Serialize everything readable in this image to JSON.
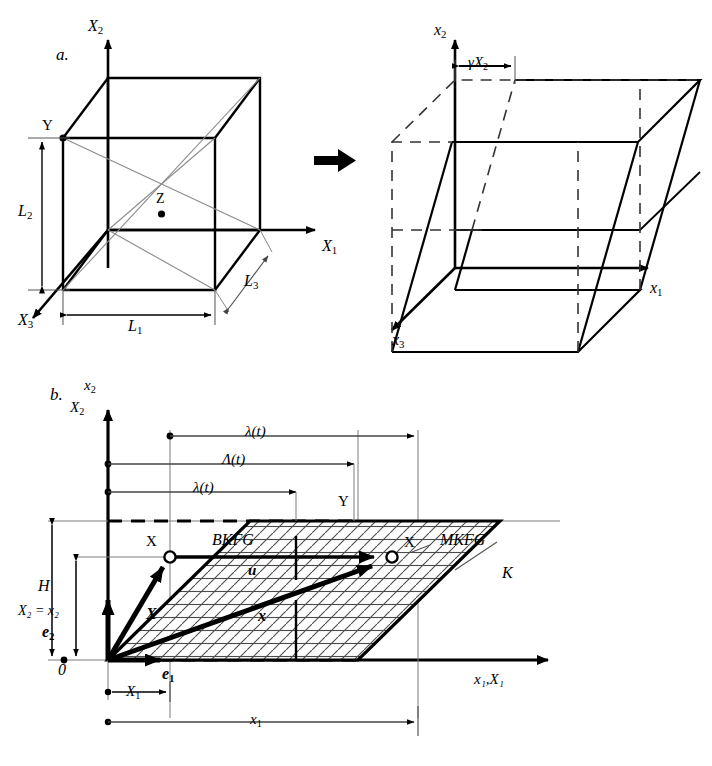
{
  "figure": {
    "background_color": "#ffffff",
    "line_color": "#000000",
    "thin_line_color": "#555555",
    "width": 712,
    "height": 766
  },
  "panel_a": {
    "letter": "a.",
    "transform_arrow": "arrow-right-icon",
    "reference_cube": {
      "axes": [
        {
          "name": "X2",
          "label": "X",
          "sub": "2",
          "direction": "up"
        },
        {
          "name": "X1",
          "label": "X",
          "sub": "1",
          "direction": "right"
        },
        {
          "name": "X3",
          "label": "X",
          "sub": "3",
          "direction": "down-left"
        }
      ],
      "points": [
        {
          "name": "Y",
          "label": "Y"
        },
        {
          "name": "Z",
          "label": "Z"
        }
      ],
      "dimensions": [
        {
          "name": "L1",
          "label": "L",
          "sub": "1",
          "orientation": "horizontal"
        },
        {
          "name": "L2",
          "label": "L",
          "sub": "2",
          "orientation": "vertical"
        },
        {
          "name": "L3",
          "label": "L",
          "sub": "3",
          "orientation": "diagonal"
        }
      ]
    },
    "deformed_cube": {
      "axes": [
        {
          "name": "x2",
          "label": "x",
          "sub": "2",
          "direction": "up"
        },
        {
          "name": "x1",
          "label": "x",
          "sub": "1",
          "direction": "right"
        },
        {
          "name": "x3",
          "label": "x",
          "sub": "3",
          "direction": "down-left"
        }
      ],
      "shear_dimension": {
        "label": "γX",
        "sub": "2"
      }
    }
  },
  "panel_b": {
    "letter": "b.",
    "axes": {
      "vertical_top": {
        "label": "x",
        "sub": "2"
      },
      "vertical_bottom": {
        "label": "X",
        "sub": "2"
      },
      "horizontal": "x₁,X₁"
    },
    "dimension_lines": [
      {
        "name": "lambda-lower-t",
        "label": "λ(t)",
        "row": 1
      },
      {
        "name": "Lambda-upper-t",
        "label": "Λ(t)",
        "row": 2
      },
      {
        "name": "lambda-lower-t-2",
        "label": "λ(t)",
        "row": 3
      },
      {
        "name": "H",
        "label": "H"
      },
      {
        "name": "X2-equals-x2",
        "label": "X₂ = x₂"
      },
      {
        "name": "X1",
        "label": "X",
        "sub": "1"
      },
      {
        "name": "x1",
        "label": "x",
        "sub": "1"
      }
    ],
    "labels": {
      "origin": "0",
      "reference_point": "X",
      "current_point": "X",
      "corner_Y": "Y",
      "reference_region": "BKFG",
      "current_region": "MKFG",
      "boundary": "K",
      "displacement_vector": "u",
      "position_vector_reference": "X",
      "position_vector_current": "x",
      "basis_vector_1": "e",
      "basis_vector_1_sub": "1",
      "basis_vector_2": "e",
      "basis_vector_2_sub": "2"
    }
  }
}
